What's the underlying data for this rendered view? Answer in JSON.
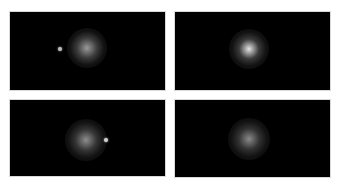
{
  "figure": {
    "background": "#ffffff",
    "panel_color": "#000000",
    "panels": [
      {
        "id": "top-left",
        "x": 10,
        "y": 12,
        "w": 155,
        "h": 78,
        "glow": {
          "cx": 77,
          "cy": 36,
          "r": 20,
          "core": "#9a9a9a",
          "mid": "#3c3c3c"
        },
        "dot": {
          "cx": 50,
          "cy": 37,
          "r": 2,
          "color": "#bdbdbd"
        }
      },
      {
        "id": "top-right",
        "x": 175,
        "y": 12,
        "w": 155,
        "h": 78,
        "glow": {
          "cx": 74,
          "cy": 37,
          "r": 20,
          "core": "#e6e6e6",
          "mid": "#3a3a3a"
        },
        "dot": null
      },
      {
        "id": "bottom-left",
        "x": 10,
        "y": 100,
        "w": 155,
        "h": 76,
        "glow": {
          "cx": 76,
          "cy": 40,
          "r": 21,
          "core": "#8e8e8e",
          "mid": "#353535"
        },
        "dot": {
          "cx": 96,
          "cy": 40,
          "r": 2,
          "color": "#cfcfcf"
        }
      },
      {
        "id": "bottom-right",
        "x": 175,
        "y": 100,
        "w": 155,
        "h": 77,
        "glow": {
          "cx": 74,
          "cy": 39,
          "r": 21,
          "core": "#8a8a8a",
          "mid": "#323232"
        },
        "dot": null
      }
    ]
  }
}
